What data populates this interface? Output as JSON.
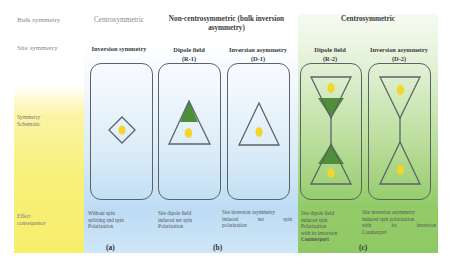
{
  "row_labels": {
    "bulk_symmetry": "Bulk symmetry",
    "site_symmetry": "Site symmetry",
    "schematic": [
      "Symmetry",
      "Schematic"
    ],
    "effect": [
      "Effect",
      "consequence"
    ]
  },
  "bulk_headers": {
    "a": "Centrosymmetric",
    "b_line1": "Non-centrosymmetric (bulk inversion",
    "b_line2": "asymmetry)",
    "c": "Centrosymmetric"
  },
  "site_headers": {
    "a": "Inversion symmetry",
    "r1_line1": "Dipole field",
    "r1_line2": "(R-1)",
    "d1_line1": "Inversion asymmetry",
    "d1_line2": "(D-1)",
    "r2_line1": "Dipole field",
    "r2_line2": "(R-2)",
    "d2_line1": "Inversion asymmetry",
    "d2_line2": "(D-2)"
  },
  "effects": {
    "a": [
      "Without spin",
      "splitting and spin",
      "Polarization"
    ],
    "r1": [
      "Site dipole field",
      "induced net spin",
      "Polarization"
    ],
    "d1": [
      "Site inversion asymmetry",
      "induced net spin",
      "polarization"
    ],
    "r2": [
      "Site dipole field",
      "induced spin",
      "Polarization",
      "with its inversion",
      "Counterpart"
    ],
    "d2": [
      "Site inversion asymmetry",
      "induced spin polarization",
      "with its inversion",
      "Counterpart"
    ]
  },
  "panel_labels": {
    "a": "(a)",
    "b": "(b)",
    "c": "(c)"
  },
  "colors": {
    "outline": "#5b6369",
    "dipole_green": "#4f8f3a",
    "atom_yellow": "#f4d62a",
    "blue_bg": "#bcdcf4",
    "green_bg": "#93cb69",
    "yellow_bg": "#f7ee6c"
  }
}
